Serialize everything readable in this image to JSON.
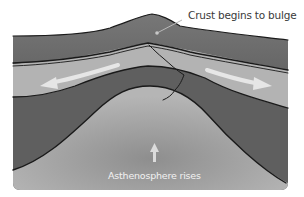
{
  "diagram": {
    "labels": {
      "crust_bulge": "Crust begins to bulge",
      "asthenosphere": "Asthenosphere rises"
    },
    "layers": [
      {
        "name": "continental-crust",
        "color": "#6e6e6e"
      },
      {
        "name": "lithospheric-mantle-upper",
        "color": "#b3b3b3"
      },
      {
        "name": "lithospheric-mantle-lower",
        "color": "#5f5f5f"
      },
      {
        "name": "asthenosphere",
        "color": "#a8a8a8"
      }
    ],
    "arrows": [
      {
        "name": "extension-arrow-left",
        "direction": "left",
        "color": "#e6e6e6"
      },
      {
        "name": "extension-arrow-right",
        "direction": "right",
        "color": "#e6e6e6"
      },
      {
        "name": "upwelling-arrow",
        "direction": "up",
        "color": "#dcdcdc"
      }
    ],
    "outline_color": "#1a1a1a"
  }
}
